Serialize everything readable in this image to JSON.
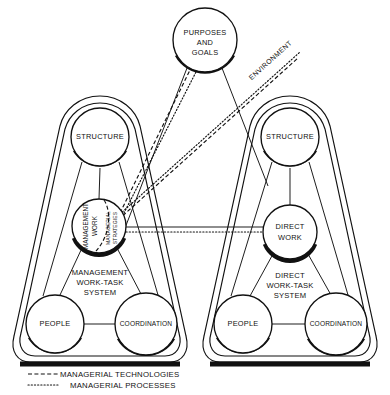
{
  "figure": {
    "background_color": "#ffffff",
    "line_color": "#111111"
  },
  "top_node": {
    "name": "purposes-and-goals",
    "lines": [
      "PURPOSES",
      "AND",
      "GOALS"
    ],
    "line1": "PURPOSES",
    "line2": "AND",
    "line3": "GOALS",
    "cx": 205,
    "cy": 40,
    "r": 32
  },
  "environment": {
    "label": "ENVIRONMENT"
  },
  "left_system": {
    "name": "management-work-task-system",
    "caption_line1": "MANAGEMENT",
    "caption_line2": "WORK-TASK",
    "caption_line3": "SYSTEM",
    "nodes": {
      "structure": {
        "label": "STRUCTURE",
        "cx": 100,
        "cy": 137,
        "r": 29
      },
      "center": {
        "label_line1": "MANAGEMENT",
        "label_line2": "WORK",
        "label_secondary_line1": "MANAGERIAL",
        "label_secondary_line2": "STRATEGIES",
        "cx": 99,
        "cy": 226,
        "r": 27
      },
      "people": {
        "label": "PEOPLE",
        "cx": 55,
        "cy": 324,
        "r": 29
      },
      "coordination": {
        "label": "COORDINATION",
        "cx": 146,
        "cy": 324,
        "r": 31
      }
    }
  },
  "right_system": {
    "name": "direct-work-task-system",
    "caption_line1": "DIRECT",
    "caption_line2": "WORK-TASK",
    "caption_line3": "SYSTEM",
    "nodes": {
      "structure": {
        "label": "STRUCTURE",
        "cx": 290,
        "cy": 137,
        "r": 29
      },
      "center": {
        "label_line1": "DIRECT",
        "label_line2": "WORK",
        "cx": 290,
        "cy": 232,
        "r": 27
      },
      "people": {
        "label": "PEOPLE",
        "cx": 243,
        "cy": 324,
        "r": 29
      },
      "coordination": {
        "label": "COORDINATION",
        "cx": 336,
        "cy": 324,
        "r": 31
      }
    }
  },
  "legend": {
    "items": [
      {
        "style": "dashed",
        "label": "MANAGERIAL TECHNOLOGIES"
      },
      {
        "style": "dotted",
        "label": "MANAGERIAL PROCESSES"
      }
    ],
    "item0_label": "MANAGERIAL TECHNOLOGIES",
    "item1_label": "MANAGERIAL PROCESSES"
  }
}
